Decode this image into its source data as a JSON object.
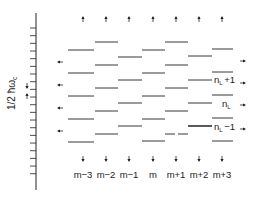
{
  "axis": {
    "label_main": "1/2 ħω",
    "label_sub": "c",
    "x": 36,
    "y_top": 13,
    "y_bottom": 190,
    "tick_start": 28,
    "tick_step": 7.67,
    "tick_count": 20,
    "marker_arrows": [
      {
        "y": 86,
        "dir": "down"
      },
      {
        "y": 96,
        "dir": "up"
      }
    ]
  },
  "columns": [
    {
      "label": "m−3",
      "x1": 68,
      "x2": 94,
      "levels": [
        50,
        73,
        96,
        119,
        142
      ],
      "cx": 83
    },
    {
      "label": "m−2",
      "x1": 95,
      "x2": 118,
      "levels": [
        42,
        65,
        88,
        111,
        134
      ],
      "cx": 106
    },
    {
      "label": "m−1",
      "x1": 118,
      "x2": 142,
      "levels": [
        57,
        80,
        103,
        126
      ],
      "cx": 129
    },
    {
      "label": "m",
      "x1": 142,
      "x2": 165,
      "levels": [
        50,
        73,
        96,
        119,
        141
      ],
      "cx": 153
    },
    {
      "label": "m+1",
      "x1": 165,
      "x2": 188,
      "levels": [
        42,
        65,
        88,
        111
      ],
      "broken_level": 134,
      "cx": 176
    },
    {
      "label": "m+2",
      "x1": 188,
      "x2": 212,
      "levels": [
        56,
        80,
        103
      ],
      "thick_level": 126,
      "cx": 199
    },
    {
      "label": "m+3",
      "x1": 212,
      "x2": 233,
      "levels": [
        49,
        72,
        95,
        118,
        141
      ],
      "cx": 222
    }
  ],
  "top_arrows_y": 19,
  "bottom_arrows_y": 159,
  "column_labels_y": 178,
  "left_arrows": {
    "x": 60,
    "ys": [
      62,
      85,
      108,
      131
    ]
  },
  "right_arrows": {
    "x": 243,
    "ys": [
      61,
      83,
      105,
      129
    ]
  },
  "level_labels": [
    {
      "main": "n",
      "sub": "L",
      "suffix": "+1",
      "x": 214,
      "y": 83
    },
    {
      "main": "n",
      "sub": "L",
      "suffix": "",
      "x": 222,
      "y": 107
    },
    {
      "main": "n",
      "sub": "L",
      "suffix": "−1",
      "x": 214,
      "y": 130
    }
  ],
  "colors": {
    "ink": "#222222",
    "background": "#ffffff"
  }
}
